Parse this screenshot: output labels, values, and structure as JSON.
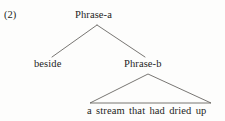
{
  "figure": {
    "example_number": "(2)",
    "type": "syntax-tree",
    "background_color": "#fdfdfc",
    "line_color": "#55534f",
    "text_color": "#1d1d1d"
  },
  "tree": {
    "root": {
      "label": "Phrase-a",
      "children": [
        {
          "label": "beside",
          "kind": "terminal"
        },
        {
          "label": "Phrase-b",
          "kind": "nonterminal",
          "children": [
            {
              "label": "a stream that had dried up",
              "kind": "triangle-terminal"
            }
          ]
        }
      ]
    }
  },
  "labels": {
    "phrase_a": "Phrase-a",
    "beside": "beside",
    "phrase_b": "Phrase-b",
    "terminal_string": "a stream that had dried up"
  },
  "geometry": {
    "branch_a": {
      "apex_x": 97,
      "apex_y": 25,
      "left_x": 52,
      "left_y": 57,
      "right_x": 145,
      "right_y": 57
    },
    "triangle_b": {
      "apex_x": 148,
      "apex_y": 74,
      "base_left_x": 90,
      "base_right_x": 211,
      "base_y": 103
    }
  }
}
